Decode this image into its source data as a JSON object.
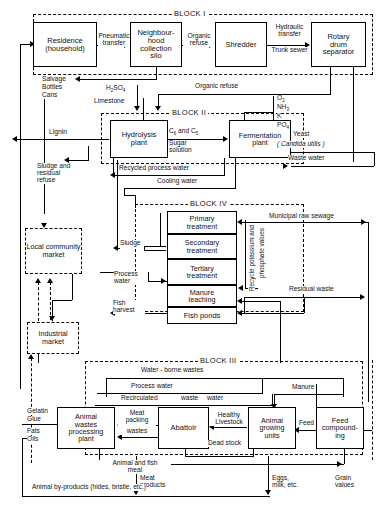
{
  "diagram": {
    "blocks": {
      "block1": "BLOCK I",
      "block2": "BLOCK II",
      "block3": "BLOCK III",
      "block4": "BLOCK IV"
    },
    "nodes": {
      "residence": "Residence\n(household)",
      "residence_l1": "Residence",
      "residence_l2": "(household)",
      "silo_l1": "Neighbour-",
      "silo_l2": "hood",
      "silo_l3": "collection",
      "silo_l4": "silo",
      "shredder": "Shredder",
      "rotary_l1": "Rotary",
      "rotary_l2": "drum",
      "rotary_l3": "separator",
      "hydrolysis_l1": "Hydrolysis",
      "hydrolysis_l2": "plant",
      "fermentation_l1": "Fermentation",
      "fermentation_l2": "plant",
      "local_market_l1": "Local",
      "local_market_l2": "community",
      "local_market_l3": "market",
      "industrial_market_l1": "Industrial",
      "industrial_market_l2": "market",
      "primary_l1": "Primary",
      "primary_l2": "treatment",
      "secondary_l1": "Secondary",
      "secondary_l2": "treatment",
      "tertiary_l1": "Tertiary",
      "tertiary_l2": "treatment",
      "manure_l1": "Manure",
      "manure_l2": "leaching",
      "fish_ponds": "Fish ponds",
      "animal_wastes_l1": "Animal",
      "animal_wastes_l2": "wastes",
      "animal_wastes_l3": "processing",
      "animal_wastes_l4": "plant",
      "abattoir": "Abattoir",
      "animal_growing_l1": "Animal",
      "animal_growing_l2": "growing",
      "animal_growing_l3": "units",
      "feed_comp_l1": "Feed",
      "feed_comp_l2": "compound-",
      "feed_comp_l3": "ing"
    },
    "flows": {
      "pneumatic_l1": "Pneumatic",
      "pneumatic_l2": "transfer",
      "organic_refuse_l1": "Organic",
      "organic_refuse_l2": "refuse",
      "hydraulic_l1": "Hydraulic",
      "hydraulic_l2": "transfer",
      "trunk_sewer": "Trunk sewer",
      "salvage": "Salvage",
      "bottles": "Bottles",
      "cans": "Cans",
      "organic_refuse_long": "Organic refuse",
      "h2so4": "H2SO4",
      "limestone": "Limestone",
      "lignin": "Lignin",
      "c6_c5": "C6 and C5",
      "sugar_l1": "Sugar",
      "sugar_l2": "solution",
      "sludge_residual_l1": "Sludge and",
      "sludge_residual_l2": "residual",
      "sludge_residual_l3": "refuse",
      "recycled_process_water": "Recycled process water",
      "cooling_water": "Cooling water",
      "o2": "O2",
      "nh3": "NH3",
      "k": "K",
      "po4": "PO4",
      "yeast": "Yeast",
      "candida": "( Candida utilis )",
      "waste_water": "Waste water",
      "municipal_raw_sewage": "Municipal raw sewage",
      "recycle_potassium": "Recycle potassium and",
      "phosphate_values": "phosphate values",
      "residual_waste": "Residual waste",
      "sludge": "Sludge",
      "process_water_l1": "Process",
      "process_water_l2": "water",
      "fish_l1": "Fish",
      "fish_l2": "harvest",
      "water_borne_wastes": "Water - borne wastes",
      "process_water": "Process water",
      "recirculated": "Recirculated",
      "waste": "waste",
      "water": "water",
      "manure": "Manure",
      "gelatin": "Gelatin",
      "glue": "Glue",
      "fats": "Fats",
      "oils": "Oils",
      "meat_packing_l1": "Meat",
      "meat_packing_l2": "packing",
      "meat_packing_l3": "wastes",
      "healthy": "Healthy",
      "livestock": "Livestock",
      "dead_stock": "Dead stock",
      "feed": "Feed",
      "animal_fish_meal_l1": "Animal and fish",
      "animal_fish_meal_l2": "meal",
      "meat_products_l1": "Meat",
      "meat_products_l2": "products",
      "eggs_l1": "Eggs,",
      "eggs_l2": "milk, etc.",
      "grain_l1": "Grain",
      "grain_l2": "values",
      "animal_byproducts": "Animal by-products (hides, bristle, etc.)"
    }
  }
}
